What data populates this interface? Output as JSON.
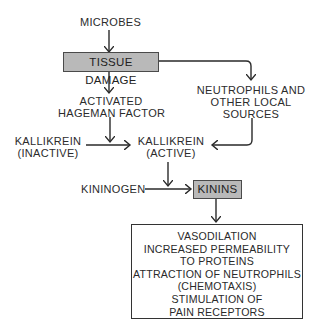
{
  "diagram": {
    "nodes": {
      "microbes": "MICROBES",
      "tissue_damage": "TISSUE DAMAGE",
      "activated_hageman_1": "ACTIVATED",
      "activated_hageman_2": "HAGEMAN FACTOR",
      "neutrophils_1": "NEUTROPHILS AND",
      "neutrophils_2": "OTHER LOCAL",
      "neutrophils_3": "SOURCES",
      "kallikrein_inactive_1": "KALLIKREIN",
      "kallikrein_inactive_2": "(INACTIVE)",
      "kallikrein_active_1": "KALLIKREIN",
      "kallikrein_active_2": "(ACTIVE)",
      "kininogen": "KININOGEN",
      "kinins": "KININS"
    },
    "effects": [
      "VASODILATION",
      "INCREASED PERMEABILITY",
      "TO PROTEINS",
      "ATTRACTION OF NEUTROPHILS",
      "(CHEMOTAXIS)",
      "STIMULATION OF",
      "PAIN RECEPTORS"
    ],
    "colors": {
      "highlight_box": "#b9b9b9",
      "line": "#2a2a2a"
    }
  }
}
